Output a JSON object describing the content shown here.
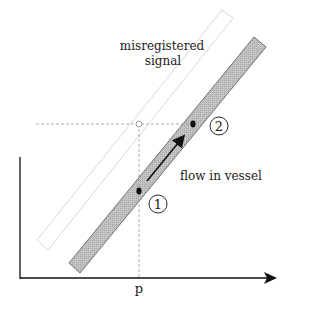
{
  "figure": {
    "panel_label": "A",
    "labels": {
      "misregistered_line1": "misregistered",
      "misregistered_line2": "signal",
      "flow": "flow in vessel",
      "x_tick": "p",
      "point1": "1",
      "point2": "2"
    },
    "colors": {
      "vessel_fill": "#bdbdbd",
      "vessel_stroke": "#4a4a4a",
      "ghost_stroke": "#d6d6d6",
      "axis": "#111111",
      "dashed": "#9a9a9a"
    }
  }
}
